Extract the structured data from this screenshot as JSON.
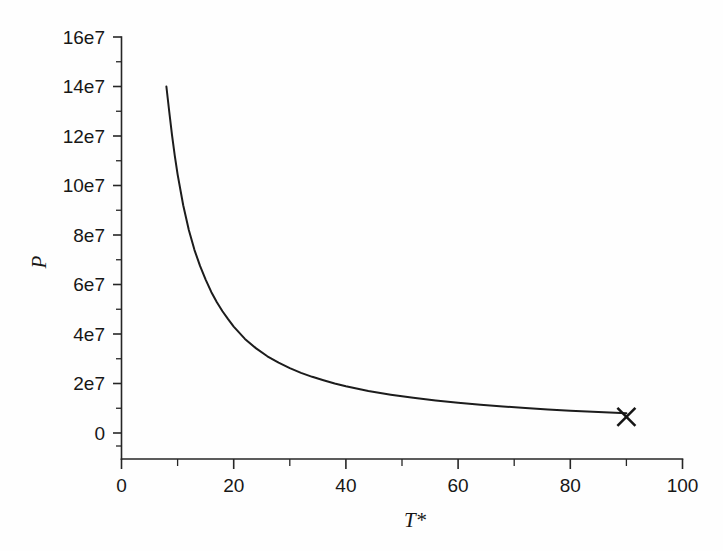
{
  "figure": {
    "background_color": "#fefefe",
    "foreground_color": "#1a1a1a"
  },
  "chart_data": {
    "type": "line",
    "title": "",
    "subtitle": "",
    "xlabel": "T*",
    "ylabel": "P",
    "xlim": [
      0,
      100
    ],
    "ylim": [
      0,
      160000000
    ],
    "grid": false,
    "legend": null,
    "x_ticks": [
      0,
      20,
      40,
      60,
      80,
      100
    ],
    "x_tick_labels": [
      "0",
      "20",
      "40",
      "60",
      "80",
      "100"
    ],
    "x_minor_ticks": [
      10,
      30,
      50,
      70,
      90
    ],
    "y_ticks": [
      0,
      20000000,
      40000000,
      60000000,
      80000000,
      100000000,
      120000000,
      140000000,
      160000000
    ],
    "y_tick_labels": [
      "0",
      "2e7",
      "4e7",
      "6e7",
      "8e7",
      "10e7",
      "12e7",
      "14e7",
      "16e7"
    ],
    "y_minor_ticks": [
      10000000,
      30000000,
      50000000,
      70000000,
      90000000,
      110000000,
      130000000,
      150000000
    ],
    "series": [
      {
        "name": "P",
        "style": "solid",
        "color": "#1c1c1c",
        "x": [
          8.0,
          8.5,
          9.0,
          9.5,
          10.0,
          11.0,
          12.0,
          13.0,
          14.0,
          15.0,
          16.0,
          17.0,
          18.0,
          19.0,
          20.0,
          22.0,
          24.0,
          26.0,
          28.0,
          30.0,
          32.0,
          34.0,
          36.0,
          38.0,
          40.0,
          44.0,
          48.0,
          52.0,
          56.0,
          60.0,
          64.0,
          68.0,
          72.0,
          76.0,
          80.0,
          84.0,
          88.0,
          90.0
        ],
        "y": [
          140000000,
          130000000,
          120500000,
          112000000,
          104500000,
          92000000,
          82000000,
          74000000,
          67500000,
          62000000,
          57000000,
          52800000,
          49200000,
          46000000,
          43000000,
          38000000,
          34200000,
          31000000,
          28400000,
          26200000,
          24300000,
          22700000,
          21300000,
          20000000,
          18900000,
          17000000,
          15500000,
          14200000,
          13100000,
          12200000,
          11400000,
          10700000,
          10100000,
          9500000,
          9000000,
          8600000,
          8200000,
          8000000
        ]
      }
    ],
    "annotations": [
      {
        "name": "endpoint-marker",
        "marker": "x",
        "x": 90,
        "y": 6500000,
        "label": ""
      }
    ]
  },
  "axis": {
    "x_title": "T*",
    "y_title": "P"
  }
}
